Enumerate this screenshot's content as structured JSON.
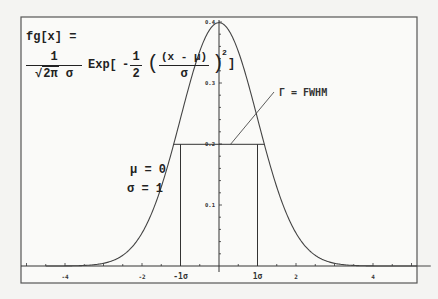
{
  "chart_data": {
    "type": "line",
    "title": "",
    "function": "fg[x] = 1/(sqrt(2 pi) sigma) Exp[-1/2 ((x - mu)/sigma)^2]",
    "series": [
      {
        "name": "gaussian",
        "mu": 0,
        "sigma": 1,
        "x_range": [
          -4.5,
          5.5
        ]
      }
    ],
    "xlim": [
      -5.2,
      5.2
    ],
    "ylim": [
      0,
      0.42
    ],
    "x_ticks": [
      -4,
      -2,
      2,
      4
    ],
    "x_tick_labels": [
      "-4",
      "-2",
      "2",
      "4"
    ],
    "y_ticks": [
      0.1,
      0.2,
      0.3,
      0.4
    ],
    "y_tick_labels": [
      "0.1",
      "0.2",
      "0.3",
      "0.4"
    ],
    "sigma_markers": [
      {
        "x": -1,
        "label": "-1σ"
      },
      {
        "x": 1,
        "label": "1σ"
      }
    ],
    "half_max_line": {
      "y": 0.1995,
      "x_from": -1.18,
      "x_to": 1.18
    },
    "annotations": [
      {
        "text": "Γ = FWHM",
        "points_to": {
          "x": 0.3,
          "y": 0.1995
        }
      }
    ],
    "grid": false,
    "legend": "none"
  },
  "formula": {
    "lhs": "fg[x] =",
    "coef_num": "1",
    "coef_den_sqrt": "2π",
    "coef_den_sigma": "σ",
    "exp": "Exp[",
    "minus": "-",
    "half_num": "1",
    "half_den": "2",
    "inner_num": "(x - μ)",
    "inner_den": "σ",
    "power": "2",
    "close": "]"
  },
  "params": {
    "mu": "μ = 0",
    "sigma": "σ = 1"
  },
  "fwhm_label": "Γ = FWHM",
  "colors": {
    "ink": "#333333",
    "curve": "#444444",
    "paper": "#f4f4f2"
  }
}
